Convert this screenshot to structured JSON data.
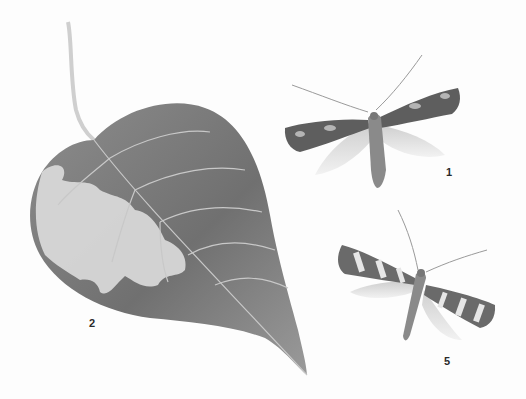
{
  "plate": {
    "background": "#fdfdfd",
    "figures": [
      {
        "number": "1",
        "subject": "moth-adult-dark-mottled-forewings",
        "label_pos": [
          446,
          167
        ]
      },
      {
        "number": "2",
        "subject": "leaf-with-blotch-mine",
        "label_pos": [
          89,
          318
        ]
      },
      {
        "number": "5",
        "subject": "moth-adult-banded-forewings",
        "label_pos": [
          444,
          356
        ]
      }
    ]
  },
  "colors": {
    "leaf_dark": "#6f6f6f",
    "leaf_mid": "#8a8a8a",
    "leaf_light": "#b8b8b8",
    "mine": "#dcdcdc",
    "vein": "#c9c9c9",
    "wing_dark": "#555555",
    "wing_light": "#e4e4e4",
    "label": "#2a2a2a"
  }
}
